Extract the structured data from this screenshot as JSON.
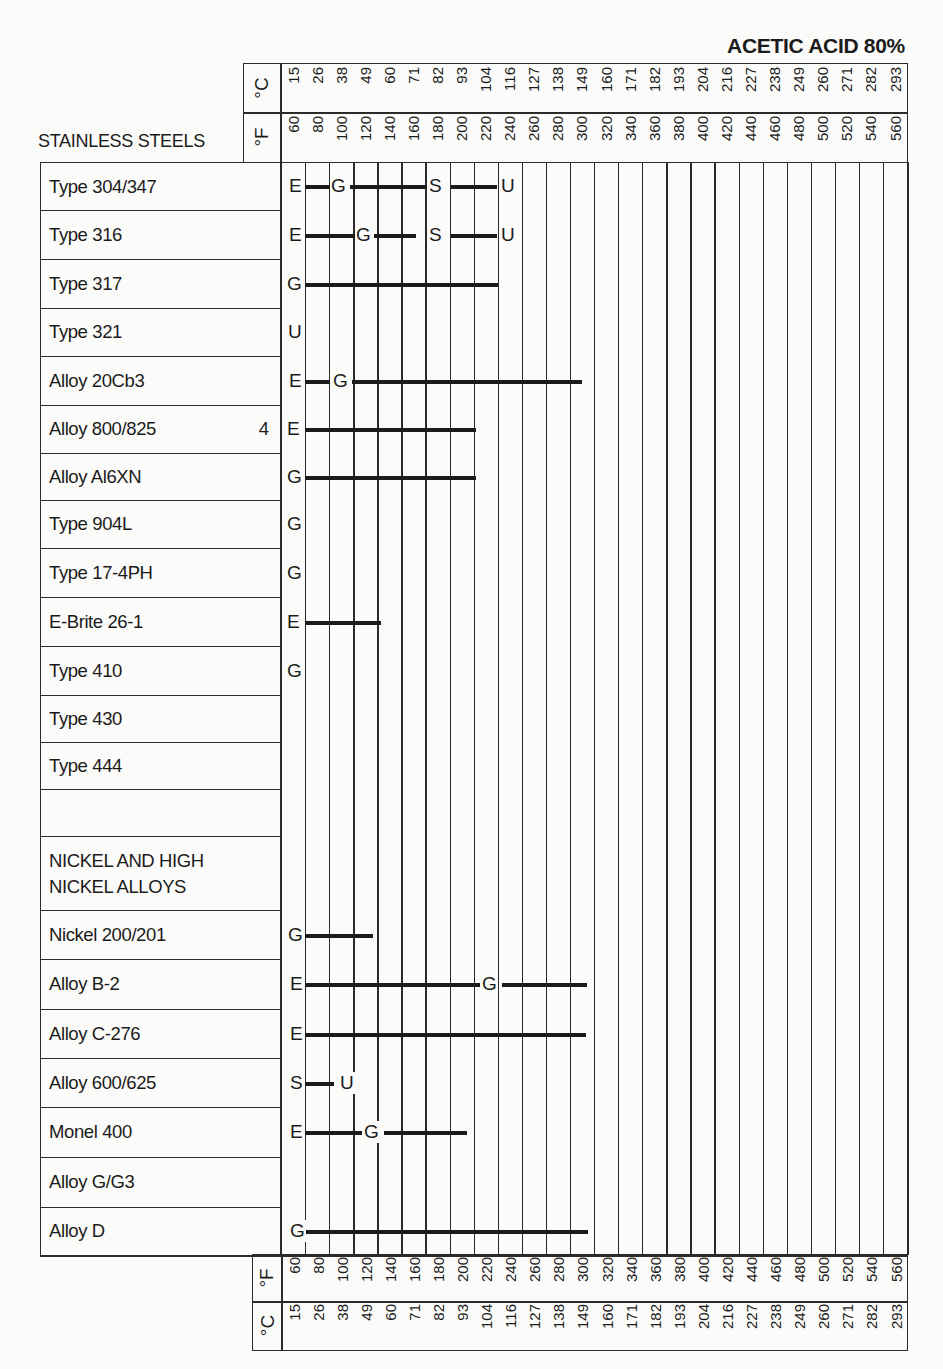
{
  "title": "ACETIC ACID 80%",
  "section_stainless": "STAINLESS STEELS",
  "section_nickel_line1": "NICKEL AND HIGH",
  "section_nickel_line2": "NICKEL ALLOYS",
  "axis": {
    "celsius_label": "°C",
    "fahrenheit_label": "°F",
    "celsius": [
      "15",
      "26",
      "38",
      "49",
      "60",
      "71",
      "82",
      "93",
      "104",
      "116",
      "127",
      "138",
      "149",
      "160",
      "171",
      "182",
      "193",
      "204",
      "216",
      "227",
      "238",
      "249",
      "260",
      "271",
      "282",
      "293"
    ],
    "fahrenheit": [
      "60",
      "80",
      "100",
      "120",
      "140",
      "160",
      "180",
      "200",
      "220",
      "240",
      "260",
      "280",
      "300",
      "320",
      "340",
      "360",
      "380",
      "400",
      "420",
      "440",
      "460",
      "480",
      "500",
      "520",
      "540",
      "560"
    ]
  },
  "rows": [
    {
      "label": "Type 304/347",
      "note": ""
    },
    {
      "label": "Type 316",
      "note": ""
    },
    {
      "label": "Type 317",
      "note": ""
    },
    {
      "label": "Type 321",
      "note": ""
    },
    {
      "label": "Alloy 20Cb3",
      "note": ""
    },
    {
      "label": "Alloy 800/825",
      "note": "4"
    },
    {
      "label": "Alloy Al6XN",
      "note": ""
    },
    {
      "label": "Type 904L",
      "note": ""
    },
    {
      "label": "Type 17-4PH",
      "note": ""
    },
    {
      "label": "E-Brite 26-1",
      "note": ""
    },
    {
      "label": "Type 410",
      "note": ""
    },
    {
      "label": "Type 430",
      "note": ""
    },
    {
      "label": "Type 444",
      "note": ""
    },
    {
      "label": "",
      "note": ""
    },
    {
      "label": "",
      "note": ""
    },
    {
      "label": "Nickel 200/201",
      "note": ""
    },
    {
      "label": "Alloy B-2",
      "note": ""
    },
    {
      "label": "Alloy C-276",
      "note": ""
    },
    {
      "label": "Alloy 600/625",
      "note": ""
    },
    {
      "label": "Monel 400",
      "note": ""
    },
    {
      "label": "Alloy G/G3",
      "note": ""
    },
    {
      "label": "Alloy D",
      "note": ""
    }
  ],
  "chart_data": {
    "type": "table",
    "title": "ACETIC ACID 80%",
    "xlabel": "Temperature (°F / °C)",
    "x_fahrenheit": [
      60,
      80,
      100,
      120,
      140,
      160,
      180,
      200,
      220,
      240,
      260,
      280,
      300,
      320,
      340,
      360,
      380,
      400,
      420,
      440,
      460,
      480,
      500,
      520,
      540,
      560
    ],
    "x_celsius": [
      15,
      26,
      38,
      49,
      60,
      71,
      82,
      93,
      104,
      116,
      127,
      138,
      149,
      160,
      171,
      182,
      193,
      204,
      216,
      227,
      238,
      249,
      260,
      271,
      282,
      293
    ],
    "legend": {
      "E": "Excellent",
      "G": "Good",
      "S": "Satisfactory",
      "U": "Unsatisfactory"
    },
    "groups": [
      {
        "name": "STAINLESS STEELS",
        "materials": [
          {
            "name": "Type 304/347",
            "segments": [
              {
                "rating": "E",
                "from_F": 60,
                "to_F": 100
              },
              {
                "rating": "G",
                "from_F": 100,
                "to_F": 180
              },
              {
                "rating": "S",
                "from_F": 180,
                "to_F": 240
              },
              {
                "rating": "U",
                "from_F": 240,
                "to_F": 240
              }
            ]
          },
          {
            "name": "Type 316",
            "segments": [
              {
                "rating": "E",
                "from_F": 60,
                "to_F": 120
              },
              {
                "rating": "G",
                "from_F": 120,
                "to_F": 160
              },
              {
                "rating": "S",
                "from_F": 180,
                "to_F": 240
              },
              {
                "rating": "U",
                "from_F": 240,
                "to_F": 240
              }
            ]
          },
          {
            "name": "Type 317",
            "segments": [
              {
                "rating": "G",
                "from_F": 60,
                "to_F": 240
              }
            ]
          },
          {
            "name": "Type 321",
            "segments": [
              {
                "rating": "U",
                "from_F": 60,
                "to_F": 60
              }
            ]
          },
          {
            "name": "Alloy 20Cb3",
            "segments": [
              {
                "rating": "E",
                "from_F": 60,
                "to_F": 100
              },
              {
                "rating": "G",
                "from_F": 100,
                "to_F": 300
              }
            ]
          },
          {
            "name": "Alloy 800/825",
            "note": "4",
            "segments": [
              {
                "rating": "E",
                "from_F": 60,
                "to_F": 220
              }
            ]
          },
          {
            "name": "Alloy Al6XN",
            "segments": [
              {
                "rating": "G",
                "from_F": 60,
                "to_F": 220
              }
            ]
          },
          {
            "name": "Type 904L",
            "segments": [
              {
                "rating": "G",
                "from_F": 60,
                "to_F": 60
              }
            ]
          },
          {
            "name": "Type 17-4PH",
            "segments": [
              {
                "rating": "G",
                "from_F": 60,
                "to_F": 60
              }
            ]
          },
          {
            "name": "E-Brite 26-1",
            "segments": [
              {
                "rating": "E",
                "from_F": 60,
                "to_F": 120
              }
            ]
          },
          {
            "name": "Type 410",
            "segments": [
              {
                "rating": "G",
                "from_F": 60,
                "to_F": 60
              }
            ]
          },
          {
            "name": "Type 430",
            "segments": []
          },
          {
            "name": "Type 444",
            "segments": []
          }
        ]
      },
      {
        "name": "NICKEL AND HIGH NICKEL ALLOYS",
        "materials": [
          {
            "name": "Nickel 200/201",
            "segments": [
              {
                "rating": "G",
                "from_F": 60,
                "to_F": 120
              }
            ]
          },
          {
            "name": "Alloy B-2",
            "segments": [
              {
                "rating": "E",
                "from_F": 60,
                "to_F": 220
              },
              {
                "rating": "G",
                "from_F": 220,
                "to_F": 300
              }
            ]
          },
          {
            "name": "Alloy C-276",
            "segments": [
              {
                "rating": "E",
                "from_F": 60,
                "to_F": 300
              }
            ]
          },
          {
            "name": "Alloy 600/625",
            "segments": [
              {
                "rating": "S",
                "from_F": 60,
                "to_F": 80
              },
              {
                "rating": "U",
                "from_F": 80,
                "to_F": 80
              }
            ]
          },
          {
            "name": "Monel 400",
            "segments": [
              {
                "rating": "E",
                "from_F": 60,
                "to_F": 120
              },
              {
                "rating": "G",
                "from_F": 120,
                "to_F": 220
              }
            ]
          },
          {
            "name": "Alloy G/G3",
            "segments": []
          },
          {
            "name": "Alloy D",
            "segments": [
              {
                "rating": "G",
                "from_F": 60,
                "to_F": 300
              }
            ]
          }
        ]
      }
    ]
  },
  "ratings_layout": [
    {
      "row": 0,
      "marks": [
        {
          "l": "E",
          "x": 289
        },
        {
          "l": "G",
          "x": 331
        },
        {
          "l": "S",
          "x": 429
        },
        {
          "l": "U",
          "x": 501
        }
      ],
      "bars": [
        [
          305,
          330
        ],
        [
          350,
          427
        ],
        [
          451,
          497
        ]
      ]
    },
    {
      "row": 1,
      "marks": [
        {
          "l": "E",
          "x": 289
        },
        {
          "l": "G",
          "x": 356
        },
        {
          "l": "S",
          "x": 429
        },
        {
          "l": "U",
          "x": 501
        }
      ],
      "bars": [
        [
          305,
          355
        ],
        [
          374,
          416
        ],
        [
          451,
          497
        ]
      ]
    },
    {
      "row": 2,
      "marks": [
        {
          "l": "G",
          "x": 287
        }
      ],
      "bars": [
        [
          305,
          498
        ]
      ]
    },
    {
      "row": 3,
      "marks": [
        {
          "l": "U",
          "x": 288
        }
      ],
      "bars": []
    },
    {
      "row": 4,
      "marks": [
        {
          "l": "E",
          "x": 289
        },
        {
          "l": "G",
          "x": 333
        }
      ],
      "bars": [
        [
          305,
          330
        ],
        [
          352,
          582
        ]
      ]
    },
    {
      "row": 5,
      "marks": [
        {
          "l": "E",
          "x": 287
        }
      ],
      "bars": [
        [
          305,
          476
        ]
      ]
    },
    {
      "row": 6,
      "marks": [
        {
          "l": "G",
          "x": 287
        }
      ],
      "bars": [
        [
          305,
          476
        ]
      ]
    },
    {
      "row": 7,
      "marks": [
        {
          "l": "G",
          "x": 287
        }
      ],
      "bars": []
    },
    {
      "row": 8,
      "marks": [
        {
          "l": "G",
          "x": 287
        }
      ],
      "bars": []
    },
    {
      "row": 9,
      "marks": [
        {
          "l": "E",
          "x": 287
        }
      ],
      "bars": [
        [
          305,
          381
        ]
      ]
    },
    {
      "row": 10,
      "marks": [
        {
          "l": "G",
          "x": 287
        }
      ],
      "bars": []
    },
    {
      "row": 15,
      "marks": [
        {
          "l": "G",
          "x": 288
        }
      ],
      "bars": [
        [
          305,
          373
        ]
      ]
    },
    {
      "row": 16,
      "marks": [
        {
          "l": "E",
          "x": 290
        },
        {
          "l": "G",
          "x": 482
        }
      ],
      "bars": [
        [
          305,
          480
        ],
        [
          502,
          587
        ]
      ]
    },
    {
      "row": 17,
      "marks": [
        {
          "l": "E",
          "x": 290
        }
      ],
      "bars": [
        [
          305,
          586
        ]
      ]
    },
    {
      "row": 18,
      "marks": [
        {
          "l": "S",
          "x": 290
        },
        {
          "l": "U",
          "x": 340
        }
      ],
      "bars": [
        [
          305,
          334
        ]
      ]
    },
    {
      "row": 19,
      "marks": [
        {
          "l": "E",
          "x": 290
        },
        {
          "l": "G",
          "x": 364
        }
      ],
      "bars": [
        [
          305,
          362
        ],
        [
          384,
          467
        ]
      ]
    },
    {
      "row": 21,
      "marks": [
        {
          "l": "G",
          "x": 290
        }
      ],
      "bars": [
        [
          305,
          588
        ]
      ]
    }
  ]
}
